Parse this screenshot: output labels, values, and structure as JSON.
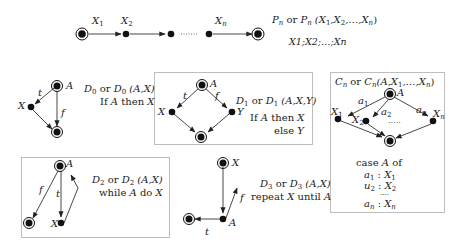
{
  "colors": {
    "node": "#111111",
    "edge": "#333333",
    "box_border": "#bdbdbd",
    "text": "#222222"
  },
  "sequence": {
    "edge_labels": [
      "X",
      "1",
      "X",
      "2",
      "X",
      "n"
    ],
    "title": {
      "name": "P",
      "sub": "n",
      "or": " or ",
      "name2": "P",
      "sub2": "n",
      "args_pre": " (X",
      "a1": "1",
      ",X": ",X",
      "a2": "2",
      ",…,X": ",…,X",
      "an": "n",
      ")": ")"
    },
    "code": "X1;X2;…;Xn",
    "dots": "……"
  },
  "d0": {
    "node_a": "A",
    "node_x": "X",
    "edge_t": "t",
    "edge_f": "f",
    "title_name": "D",
    "title_sub": "0",
    "title_or": " or ",
    "title_name2": "D",
    "title_sub2": "0",
    "title_args": " (A,X)",
    "desc_pre": "If ",
    "desc_a": "A",
    "desc_mid": " then ",
    "desc_x": "X"
  },
  "d1": {
    "node_a": "A",
    "node_x": "X",
    "node_y": "Y",
    "edge_t": "t",
    "edge_f": "f",
    "title_name": "D",
    "title_sub": "1",
    "title_or": " or ",
    "title_name2": "D",
    "title_sub2": "1",
    "title_args": " (A,X,Y)",
    "line1_pre": "If ",
    "line1_a": "A",
    "line1_mid": " then ",
    "line1_x": "X",
    "line2_pre": "else ",
    "line2_y": "Y"
  },
  "cn": {
    "title_name": "C",
    "title_sub": "n",
    "title_or": " or ",
    "title_name2": "C",
    "title_sub2": "n",
    "title_args_pre": "(A,X",
    "title_a1": "1",
    "title_args_mid": ",…,X",
    "title_an": "n",
    "title_close": ")",
    "node_a": "A",
    "x1": "X",
    "x1_sub": "1",
    "x2": "X",
    "x2_sub": "2",
    "xn": "X",
    "xn_sub": "n",
    "a1": "a",
    "a1_sub": "1",
    "a2": "a",
    "a2_sub": "2",
    "an": "a",
    "an_sub": "n",
    "dots": "·····",
    "case_pre": "case ",
    "case_a": "A",
    "case_post": " of",
    "cases": [
      {
        "a": "a",
        "a_sub": "1",
        "sep": " : ",
        "x": "X",
        "x_sub": "1"
      },
      {
        "a": "u",
        "a_sub": "2",
        "sep": " : ",
        "x": "X",
        "x_sub": "2"
      },
      {
        "a": "a",
        "a_sub": "n",
        "sep": " : ",
        "x": "X",
        "x_sub": "n"
      }
    ],
    "case_dots": "····"
  },
  "d2": {
    "node_a": "A",
    "node_x": "X",
    "edge_t": "t",
    "edge_f": "f",
    "title_name": "D",
    "title_sub": "2",
    "title_or": " or ",
    "title_name2": "D",
    "title_sub2": "2",
    "title_args": " (A,X)",
    "desc_pre": "while ",
    "desc_a": "A",
    "desc_mid": " do ",
    "desc_x": "X"
  },
  "d3": {
    "node_a": "A",
    "node_x": "X",
    "edge_t": "t",
    "edge_f": "f",
    "title_name": "D",
    "title_sub": "3",
    "title_or": " or ",
    "title_name2": "D",
    "title_sub2": "3",
    "title_args": " (A,X)",
    "desc_pre": "repeat ",
    "desc_x": "X",
    "desc_mid": " until ",
    "desc_a": "A"
  }
}
